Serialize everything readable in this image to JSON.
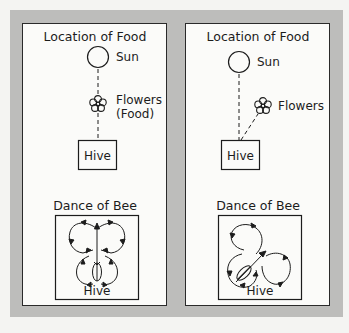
{
  "colors": {
    "background": "#f4f4f2",
    "frame": "#bdbdbb",
    "panel": "#fbfbf9",
    "ink": "#1c1c1c"
  },
  "panels": [
    {
      "title": "Location of Food",
      "sun_label": "Sun",
      "flower_label_1": "Flowers",
      "flower_label_2": "(Food)",
      "hive_label": "Hive",
      "dance_title": "Dance of Bee",
      "dance_hive_label": "Hive",
      "food_direction": "toward the sun (straight up)"
    },
    {
      "title": "Location of Food",
      "sun_label": "Sun",
      "flower_label_1": "Flowers",
      "hive_label": "Hive",
      "dance_title": "Dance of Bee",
      "dance_hive_label": "Hive",
      "food_direction": "angled right of the sun"
    }
  ]
}
